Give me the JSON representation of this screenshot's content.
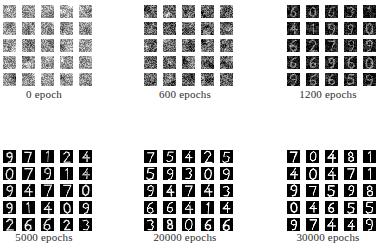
{
  "figure": {
    "type": "generative-model-training-progression",
    "background_color": "#ffffff",
    "caption_color": "#2e2e2e",
    "grid_rows": 2,
    "grid_cols": 3,
    "samples_per_panel": 25,
    "sample_grid_rows": 5,
    "sample_grid_cols": 5,
    "sample_kind": "handwritten-digit"
  },
  "panels": [
    {
      "id": "panel-0-epoch",
      "caption": "0 epoch",
      "epochs": 0,
      "stage": "pure-noise",
      "mean_gray": "#9a9a9a",
      "contrast": 0.16,
      "digit_strength": 0.0,
      "noise_scale": 1.0,
      "seed": 11
    },
    {
      "id": "panel-600-epochs",
      "caption": "600 epochs",
      "epochs": 600,
      "stage": "structured-noise",
      "mean_gray": "#6e6e6e",
      "contrast": 0.42,
      "digit_strength": 0.12,
      "noise_scale": 0.85,
      "seed": 23
    },
    {
      "id": "panel-1200-epochs",
      "caption": "1200 epochs",
      "epochs": 1200,
      "stage": "emerging-strokes",
      "mean_gray": "#3a3a3a",
      "contrast": 0.66,
      "digit_strength": 0.42,
      "noise_scale": 0.55,
      "seed": 37
    },
    {
      "id": "panel-5000-epochs",
      "caption": "5000 epochs",
      "epochs": 5000,
      "stage": "recognizable-digits",
      "mean_gray": "#1b1b1b",
      "contrast": 0.86,
      "digit_strength": 0.8,
      "noise_scale": 0.24,
      "seed": 53
    },
    {
      "id": "panel-20000-epochs",
      "caption": "20000 epochs",
      "epochs": 20000,
      "stage": "clear-digits",
      "mean_gray": "#141414",
      "contrast": 0.93,
      "digit_strength": 0.92,
      "noise_scale": 0.14,
      "seed": 71
    },
    {
      "id": "panel-30000-epochs",
      "caption": "30000 epochs",
      "epochs": 30000,
      "stage": "sharp-digits",
      "mean_gray": "#101010",
      "contrast": 0.96,
      "digit_strength": 1.0,
      "noise_scale": 0.09,
      "seed": 89
    }
  ],
  "panel_digits": {
    "panel-0-epoch": [
      "",
      "",
      "",
      "",
      "",
      "",
      "",
      "",
      "",
      "",
      "",
      "",
      "",
      "",
      "",
      "",
      "",
      "",
      "",
      "",
      "",
      "",
      "",
      "",
      ""
    ],
    "panel-600-epochs": [
      "",
      "",
      "1",
      "1",
      "1",
      "",
      "",
      "",
      "",
      "",
      "",
      "",
      "1",
      "1",
      "",
      "",
      "1",
      "1",
      "",
      "",
      "7",
      "1",
      "",
      "",
      "1"
    ],
    "panel-1200-epochs": [
      "6",
      "0",
      "6",
      "3",
      "1",
      "4",
      "1",
      "9",
      "9",
      "0",
      "6",
      "2",
      "7",
      "9",
      "9",
      "6",
      "6",
      "9",
      "6",
      "0",
      "9",
      "6",
      "6",
      "5",
      "9"
    ],
    "panel-5000-epochs": [
      "9",
      "7",
      "1",
      "2",
      "4",
      "0",
      "7",
      "9",
      "1",
      "4",
      "9",
      "4",
      "7",
      "7",
      "0",
      "9",
      "1",
      "4",
      "0",
      "9",
      "2",
      "6",
      "6",
      "2",
      "3"
    ],
    "panel-20000-epochs": [
      "7",
      "5",
      "4",
      "2",
      "5",
      "5",
      "9",
      "3",
      "0",
      "9",
      "9",
      "4",
      "7",
      "4",
      "3",
      "6",
      "6",
      "4",
      "1",
      "4",
      "3",
      "8",
      "0",
      "6",
      "6"
    ],
    "panel-30000-epochs": [
      "7",
      "0",
      "4",
      "8",
      "1",
      "4",
      "0",
      "4",
      "7",
      "1",
      "9",
      "7",
      "5",
      "9",
      "8",
      "0",
      "4",
      "6",
      "5",
      "5",
      "9",
      "7",
      "4",
      "4",
      "9"
    ]
  }
}
